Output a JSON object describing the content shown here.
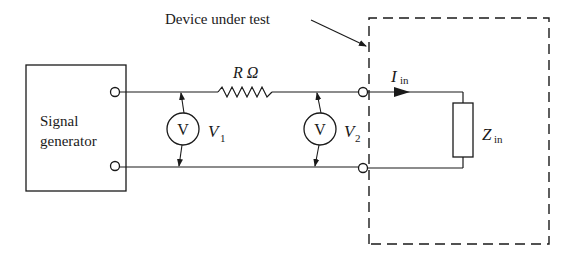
{
  "diagram": {
    "labels": {
      "device_under_test": "Device under test",
      "signal_generator_line1": "Signal",
      "signal_generator_line2": "generator",
      "resistor": "R Ω",
      "voltmeter1_symbol": "V",
      "voltmeter2_symbol": "V",
      "v1_main": "V",
      "v1_sub": "1",
      "v2_main": "V",
      "v2_sub": "2",
      "current_main": "I",
      "current_sub": "in",
      "impedance_main": "Z",
      "impedance_sub": "in"
    },
    "components": [
      {
        "id": "signal-generator",
        "type": "source-box"
      },
      {
        "id": "series-resistor",
        "type": "resistor",
        "label": "R Ω"
      },
      {
        "id": "voltmeter-1",
        "type": "voltmeter",
        "label": "V1"
      },
      {
        "id": "voltmeter-2",
        "type": "voltmeter",
        "label": "V2"
      },
      {
        "id": "input-impedance",
        "type": "impedance",
        "label": "Zin"
      },
      {
        "id": "device-under-test",
        "type": "dashed-boundary"
      }
    ],
    "colors": {
      "ink": "#1a1a1a",
      "background": "#ffffff"
    }
  }
}
